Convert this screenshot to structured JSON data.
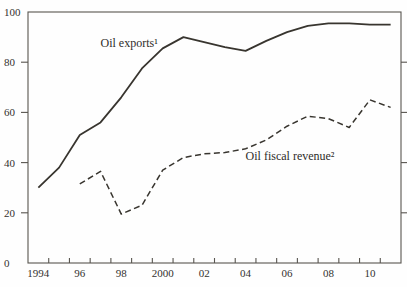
{
  "chart_data": {
    "type": "line",
    "title": "",
    "background": "#fefefe",
    "frame_color": "#58554f",
    "line_color": "#38352f",
    "text_color": "#33312e",
    "legend_position": "inline-annotations",
    "grid": false,
    "y_axis": {
      "min": 0,
      "max": 100,
      "labels": [
        "0",
        "20",
        "40",
        "60",
        "80",
        "100"
      ],
      "label_values": [
        0,
        20,
        40,
        60,
        80,
        100
      ],
      "tick_values": [
        20,
        40,
        60,
        80
      ],
      "ticks_on_right_side": true
    },
    "x_axis": {
      "start": 1994,
      "end": 2011,
      "minor_ticks": "yearly",
      "tick_labels": [
        {
          "label": "1994",
          "year": 1994
        },
        {
          "label": "96",
          "year": 1996
        },
        {
          "label": "98",
          "year": 1998
        },
        {
          "label": "2000",
          "year": 2000
        },
        {
          "label": "02",
          "year": 2002
        },
        {
          "label": "04",
          "year": 2004
        },
        {
          "label": "06",
          "year": 2006
        },
        {
          "label": "08",
          "year": 2008
        },
        {
          "label": "10",
          "year": 2010
        }
      ]
    },
    "series": [
      {
        "name": "Oil exports¹",
        "line_style": "solid",
        "color": "#38352f",
        "x": [
          1994,
          1995,
          1996,
          1997,
          1998,
          1999,
          2000,
          2001,
          2002,
          2003,
          2004,
          2005,
          2006,
          2007,
          2008,
          2009,
          2010,
          2011
        ],
        "values": [
          30,
          38,
          51,
          56,
          66,
          77.5,
          85.5,
          90,
          88,
          86,
          84.5,
          88.5,
          92,
          94.5,
          95.5,
          95.5,
          95,
          95
        ],
        "label_pos": {
          "year": 1997,
          "value": 86
        }
      },
      {
        "name": "Oil fiscal revenue²",
        "line_style": "dashed",
        "color": "#38352f",
        "x": [
          1996,
          1997,
          1998,
          1999,
          2000,
          2001,
          2002,
          2003,
          2004,
          2005,
          2006,
          2007,
          2008,
          2009,
          2010,
          2011
        ],
        "values": [
          31.5,
          36.5,
          19.5,
          23,
          37,
          42,
          43.5,
          44,
          45.5,
          49,
          54.5,
          58.5,
          57.5,
          54,
          65,
          62
        ],
        "label_pos": {
          "year": 2004,
          "value": 41
        }
      }
    ]
  }
}
